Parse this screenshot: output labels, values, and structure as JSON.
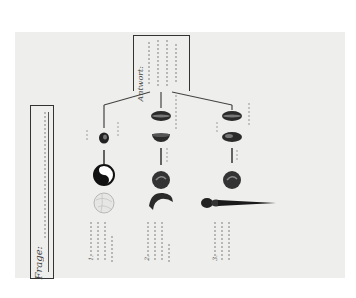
{
  "document": {
    "type": "handwritten embryology teaching chart (rotated 90°)",
    "question_box": {
      "label": "Frage:",
      "text": "(handwritten question, illegible)"
    },
    "answer_box": {
      "label": "Antwort:",
      "text": "(handwritten answer, 5 lines, illegible)"
    },
    "rows": [
      {
        "label": "1.",
        "caption": "(handwritten description, 4 lines)",
        "figures": [
          "small-dark-egg",
          "yin-yang-egg",
          "pale-cleaved-egg"
        ]
      },
      {
        "label": "2.",
        "caption": "(handwritten description, 4 lines)",
        "figures": [
          "elongated-oval",
          "half-dome",
          "dark-round-embryo",
          "curved-embryo"
        ]
      },
      {
        "label": "3.",
        "caption": "(handwritten description, 3 lines)",
        "figures": [
          "elongated-oval",
          "oval",
          "dark-round-embryo",
          "tadpole-larva"
        ]
      }
    ]
  },
  "colors": {
    "page": "#ffffff",
    "sheet": "#eeeeec",
    "ink": "#333333"
  }
}
